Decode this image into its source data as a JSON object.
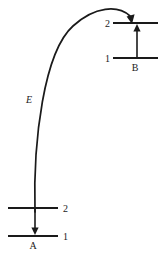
{
  "figure": {
    "type": "energy-level-transfer-diagram",
    "background_color": "#ffffff",
    "line_color": "#1a1a1a"
  },
  "atom_a": {
    "name": "A",
    "label": "A",
    "levels": [
      {
        "id": "a-level-2",
        "label": "2",
        "label_side": "right"
      },
      {
        "id": "a-level-1",
        "label": "1",
        "label_side": "right"
      }
    ],
    "transition": {
      "name": "a-downward-transition",
      "direction": "down",
      "from_level": "2",
      "to_level": "1"
    }
  },
  "atom_b": {
    "name": "B",
    "label": "B",
    "levels": [
      {
        "id": "b-level-2",
        "label": "2",
        "label_side": "left"
      },
      {
        "id": "b-level-1",
        "label": "1",
        "label_side": "left"
      }
    ],
    "transition": {
      "name": "b-upward-transition",
      "direction": "up",
      "from_level": "1",
      "to_level": "2"
    }
  },
  "energy_transfer": {
    "label": "E",
    "description": "curved arrow from atom A to atom B level 2",
    "direction": "a-to-b"
  }
}
